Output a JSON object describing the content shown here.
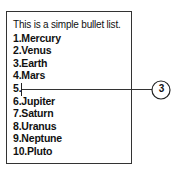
{
  "document": {
    "intro": "This is a simple bullet list.",
    "items": [
      "1.Mercury",
      "2.Venus",
      "3.Earth",
      "4.Mars",
      "5.",
      "6.Jupiter",
      "7.Saturn",
      "8.Uranus",
      "9.Neptune",
      "10.Pluto"
    ]
  },
  "callout": {
    "label": "3"
  }
}
